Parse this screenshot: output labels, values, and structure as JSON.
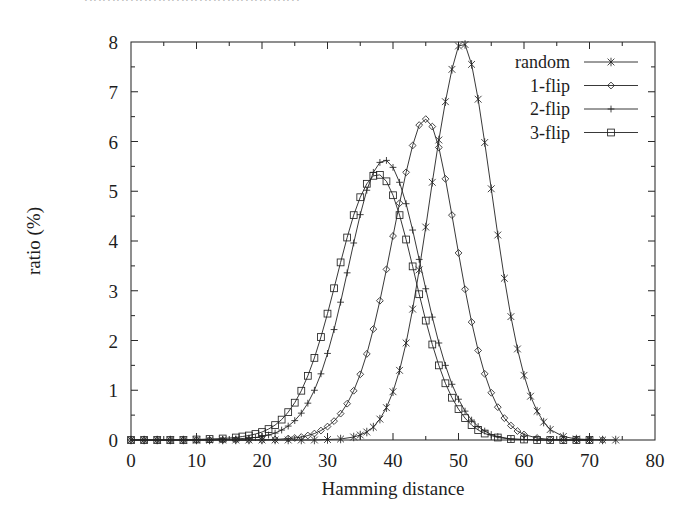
{
  "page": {
    "top_partial_text": "⋅⋅⋅⋅⋅⋅⋅⋅⋅⋅⋅⋅⋅⋅⋅⋅⋅⋅⋅⋅⋅⋅⋅⋅⋅⋅⋅⋅⋅⋅⋅⋅⋅⋅⋅⋅⋅⋅⋅⋅⋅⋅⋅⋅⋅⋅⋅"
  },
  "chart_data": {
    "type": "line",
    "title": "",
    "xlabel": "Hamming distance",
    "ylabel": "ratio (%)",
    "xlim": [
      0,
      80
    ],
    "ylim": [
      0,
      8
    ],
    "xticks": [
      0,
      10,
      20,
      30,
      40,
      50,
      60,
      70,
      80
    ],
    "yticks": [
      0,
      1,
      2,
      3,
      4,
      5,
      6,
      7,
      8
    ],
    "xtick_labels": [
      "0",
      "10",
      "20",
      "30",
      "40",
      "50",
      "60",
      "70",
      "80"
    ],
    "ytick_labels": [
      "0",
      "1",
      "2",
      "3",
      "4",
      "5",
      "6",
      "7",
      "8"
    ],
    "grid": false,
    "minor_ticks": true,
    "legend_position": "top-right",
    "legend": [
      "random",
      "1-flip",
      "2-flip",
      "3-flip"
    ],
    "series": [
      {
        "name": "random",
        "marker": "star",
        "peak_x": 50,
        "peak_y": 8.0,
        "x": [
          0,
          2,
          4,
          6,
          8,
          10,
          12,
          14,
          16,
          18,
          20,
          22,
          24,
          26,
          28,
          30,
          32,
          34,
          35,
          36,
          37,
          38,
          39,
          40,
          41,
          42,
          43,
          44,
          45,
          46,
          47,
          48,
          49,
          50,
          51,
          52,
          53,
          54,
          55,
          56,
          57,
          58,
          59,
          60,
          61,
          62,
          63,
          64,
          66,
          68,
          70,
          72,
          74
        ],
        "values": [
          0,
          0,
          0,
          0,
          0,
          0,
          0,
          0,
          0,
          0,
          0,
          0,
          0,
          0,
          0,
          0.01,
          0.02,
          0.06,
          0.1,
          0.16,
          0.26,
          0.42,
          0.65,
          0.97,
          1.4,
          1.95,
          2.63,
          3.42,
          4.28,
          5.18,
          6.03,
          6.8,
          7.45,
          7.92,
          7.95,
          7.55,
          6.85,
          5.98,
          5.05,
          4.12,
          3.25,
          2.48,
          1.83,
          1.3,
          0.88,
          0.58,
          0.36,
          0.21,
          0.07,
          0.02,
          0.01,
          0,
          0
        ]
      },
      {
        "name": "1-flip",
        "marker": "diamond",
        "peak_x": 44,
        "peak_y": 6.45,
        "x": [
          0,
          2,
          4,
          6,
          8,
          10,
          12,
          14,
          16,
          18,
          20,
          22,
          24,
          25,
          26,
          27,
          28,
          29,
          30,
          31,
          32,
          33,
          34,
          35,
          36,
          37,
          38,
          39,
          40,
          41,
          42,
          43,
          44,
          45,
          46,
          47,
          48,
          49,
          50,
          51,
          52,
          53,
          54,
          55,
          56,
          57,
          58,
          59,
          60,
          62,
          64,
          66,
          68,
          70,
          72
        ],
        "values": [
          0,
          0,
          0,
          0,
          0,
          0,
          0,
          0,
          0,
          0,
          0,
          0.01,
          0.03,
          0.04,
          0.06,
          0.09,
          0.13,
          0.19,
          0.27,
          0.38,
          0.53,
          0.73,
          0.99,
          1.32,
          1.73,
          2.23,
          2.8,
          3.43,
          4.1,
          4.76,
          5.38,
          5.92,
          6.33,
          6.45,
          6.3,
          5.88,
          5.25,
          4.52,
          3.76,
          3.03,
          2.37,
          1.8,
          1.33,
          0.95,
          0.66,
          0.44,
          0.29,
          0.18,
          0.11,
          0.04,
          0.01,
          0,
          0,
          0,
          0
        ]
      },
      {
        "name": "2-flip",
        "marker": "plus",
        "peak_x": 39,
        "peak_y": 5.65,
        "x": [
          0,
          2,
          4,
          6,
          8,
          10,
          12,
          14,
          16,
          18,
          19,
          20,
          21,
          22,
          23,
          24,
          25,
          26,
          27,
          28,
          29,
          30,
          31,
          32,
          33,
          34,
          35,
          36,
          37,
          38,
          39,
          40,
          41,
          42,
          43,
          44,
          45,
          46,
          47,
          48,
          49,
          50,
          51,
          52,
          53,
          54,
          55,
          56,
          58,
          60,
          62,
          64,
          66,
          68,
          70
        ],
        "values": [
          0,
          0,
          0,
          0,
          0,
          0,
          0,
          0.01,
          0.02,
          0.04,
          0.05,
          0.07,
          0.1,
          0.14,
          0.2,
          0.28,
          0.39,
          0.54,
          0.74,
          1.0,
          1.33,
          1.74,
          2.22,
          2.77,
          3.36,
          3.96,
          4.53,
          5.02,
          5.38,
          5.58,
          5.62,
          5.48,
          5.18,
          4.75,
          4.22,
          3.63,
          3.04,
          2.47,
          1.95,
          1.5,
          1.12,
          0.82,
          0.58,
          0.4,
          0.27,
          0.18,
          0.11,
          0.07,
          0.02,
          0.01,
          0,
          0,
          0,
          0,
          0
        ]
      },
      {
        "name": "3-flip",
        "marker": "square",
        "peak_x": 37,
        "peak_y": 5.35,
        "x": [
          0,
          2,
          4,
          6,
          8,
          10,
          12,
          14,
          16,
          17,
          18,
          19,
          20,
          21,
          22,
          23,
          24,
          25,
          26,
          27,
          28,
          29,
          30,
          31,
          32,
          33,
          34,
          35,
          36,
          37,
          38,
          39,
          40,
          41,
          42,
          43,
          44,
          45,
          46,
          47,
          48,
          49,
          50,
          51,
          52,
          53,
          54,
          56,
          58,
          60,
          62,
          64,
          66,
          68,
          70
        ],
        "values": [
          0,
          0,
          0,
          0,
          0,
          0.01,
          0.02,
          0.03,
          0.05,
          0.07,
          0.09,
          0.12,
          0.16,
          0.22,
          0.3,
          0.41,
          0.56,
          0.75,
          0.99,
          1.29,
          1.65,
          2.07,
          2.54,
          3.05,
          3.57,
          4.07,
          4.52,
          4.88,
          5.15,
          5.31,
          5.33,
          5.2,
          4.92,
          4.52,
          4.03,
          3.49,
          2.93,
          2.4,
          1.92,
          1.5,
          1.14,
          0.85,
          0.62,
          0.44,
          0.3,
          0.2,
          0.13,
          0.05,
          0.02,
          0.01,
          0,
          0,
          0,
          0,
          0
        ]
      }
    ]
  }
}
